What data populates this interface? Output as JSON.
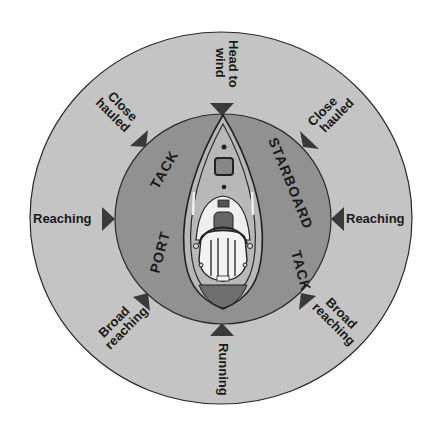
{
  "diagram": {
    "colors": {
      "background": "#ffffff",
      "outer_ring": "#c4c4c4",
      "inner_ring": "#919191",
      "arrow": "#3a3a3a",
      "hull_deck": "#b8b8b8",
      "stern": "#6e6e6e",
      "text": "#1a1a1a"
    },
    "points_of_sail": {
      "head_to_wind": [
        "Head to",
        "wind"
      ],
      "close_hauled_left": [
        "Close",
        "hauled"
      ],
      "close_hauled_right": [
        "Close",
        "hauled"
      ],
      "reaching_left": "Reaching",
      "reaching_right": "Reaching",
      "broad_reaching_left": [
        "Broad",
        "reaching"
      ],
      "broad_reaching_right": [
        "Broad",
        "reaching"
      ],
      "running": "Running"
    },
    "tacks": {
      "port": [
        "PORT",
        "TACK"
      ],
      "starboard": [
        "STARBOARD",
        "TACK"
      ]
    }
  }
}
